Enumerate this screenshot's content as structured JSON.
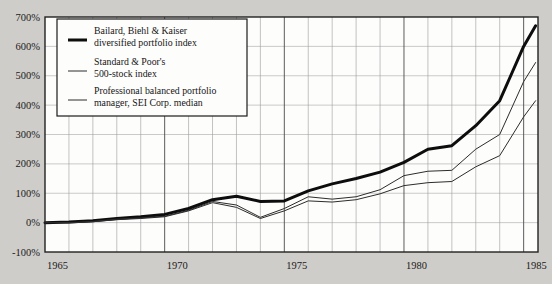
{
  "chart_data": {
    "type": "line",
    "title": "",
    "subtitle": "",
    "xlabel": "",
    "ylabel": "",
    "xlim": [
      1965,
      1985.6
    ],
    "ylim": [
      -100,
      700
    ],
    "grid": true,
    "legend_position": "top-left",
    "y_ticks": [
      700,
      600,
      500,
      400,
      300,
      200,
      100,
      0,
      -100
    ],
    "y_tick_labels": [
      "700%",
      "600%",
      "500%",
      "400%",
      "300%",
      "200%",
      "100%",
      "0%",
      "-100%"
    ],
    "x_ticks": [
      1965,
      1970,
      1975,
      1980,
      1985
    ],
    "x_tick_labels": [
      "1965",
      "1970",
      "1975",
      "1980",
      "1985"
    ],
    "x_minor_ticks": [
      1966,
      1967,
      1968,
      1969,
      1971,
      1972,
      1973,
      1974,
      1976,
      1977,
      1978,
      1979,
      1981,
      1982,
      1983,
      1984
    ],
    "x": [
      1965,
      1966,
      1967,
      1968,
      1969,
      1970,
      1971,
      1972,
      1973,
      1974,
      1975,
      1976,
      1977,
      1978,
      1979,
      1980,
      1981,
      1982,
      1983,
      1984,
      1985,
      1985.5
    ],
    "series": [
      {
        "name": "Bailard, Biehl & Kaiser diversified portfolio index",
        "style": "thick",
        "values": [
          0,
          2,
          6,
          14,
          20,
          28,
          48,
          78,
          90,
          72,
          74,
          108,
          132,
          150,
          172,
          205,
          250,
          262,
          330,
          415,
          600,
          670
        ]
      },
      {
        "name": "Standard & Poor's 500-stock index",
        "style": "thin",
        "values": [
          0,
          0,
          4,
          12,
          16,
          22,
          42,
          72,
          60,
          18,
          48,
          88,
          80,
          88,
          112,
          160,
          175,
          178,
          250,
          300,
          480,
          545
        ]
      },
      {
        "name": "Professional balanced portfolio manager, SEI Corp. median",
        "style": "thin",
        "values": [
          0,
          -1,
          3,
          10,
          14,
          20,
          40,
          68,
          52,
          14,
          40,
          74,
          70,
          78,
          98,
          126,
          136,
          140,
          190,
          228,
          360,
          415
        ]
      }
    ],
    "legend": [
      {
        "swatch": "thick-line-swatch",
        "line1": "Bailard, Biehl & Kaiser",
        "line2": "diversified portfolio index"
      },
      {
        "swatch": "thin-line-swatch",
        "line1": "Standard & Poor's",
        "line2": "500-stock index"
      },
      {
        "swatch": "thin-line-swatch",
        "line1": "Professional balanced portfolio",
        "line2": "manager, SEI Corp. median"
      }
    ]
  }
}
